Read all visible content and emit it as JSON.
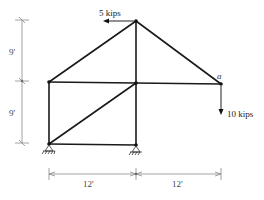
{
  "diagram": {
    "type": "truss",
    "loads": [
      {
        "label": "5 kips",
        "direction": "left",
        "at": "top-node"
      },
      {
        "label": "10 kips",
        "direction": "down",
        "at": "node-a"
      }
    ],
    "node_labels": {
      "a": "a"
    },
    "dimensions": {
      "vertical": [
        "9'",
        "9'"
      ],
      "horizontal": [
        "12'",
        "12'"
      ]
    },
    "colors": {
      "member": "#1a1a1a",
      "dimension": "#8a8a8a",
      "background": "#ffffff"
    }
  }
}
